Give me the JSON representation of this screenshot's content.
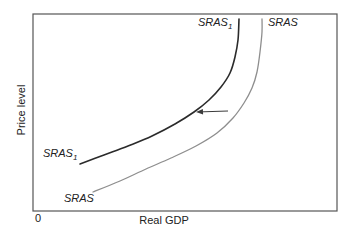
{
  "figure": {
    "y_axis_label": "Price level",
    "x_axis_label": "Real GDP",
    "origin_label": "0",
    "curve_labels": {
      "sras1_top": {
        "base": "SRAS",
        "sub": "1"
      },
      "sras_top": {
        "base": "SRAS",
        "sub": ""
      },
      "sras1_bottom": {
        "base": "SRAS",
        "sub": "1"
      },
      "sras_bottom": {
        "base": "SRAS",
        "sub": ""
      }
    },
    "colors": {
      "sras1_curve": "#2b2b2b",
      "sras_curve": "#8e8e8e",
      "plot_border": "#555555",
      "arrow": "#3a3a3a",
      "text": "#222222",
      "background": "#ffffff"
    }
  },
  "chart_data": {
    "type": "line",
    "title": "",
    "xlabel": "Real GDP",
    "ylabel": "Price level",
    "axis_values": "qualitative diagram - no numeric ticks, origin labeled 0",
    "layout": {
      "canvas": [
        348,
        239
      ],
      "plot_box": {
        "x": 33,
        "y": 14,
        "width": 304,
        "height": 197
      },
      "grid": false,
      "legend": "curve names labeled at top and bottom ends of each curve"
    },
    "series": [
      {
        "name": "SRAS1",
        "display_label": "SRAS₁",
        "color": "#2b2b2b",
        "stroke_width": 1.6,
        "points_px": [
          [
            80,
            164
          ],
          [
            104,
            155
          ],
          [
            128,
            146
          ],
          [
            152,
            136
          ],
          [
            175,
            124
          ],
          [
            194,
            112
          ],
          [
            209,
            100
          ],
          [
            221,
            87
          ],
          [
            230,
            73
          ],
          [
            235,
            57
          ],
          [
            238,
            40
          ],
          [
            239,
            19
          ]
        ]
      },
      {
        "name": "SRAS",
        "display_label": "SRAS",
        "color": "#8e8e8e",
        "stroke_width": 1.3,
        "points_px": [
          [
            93,
            192
          ],
          [
            120,
            181
          ],
          [
            146,
            169
          ],
          [
            171,
            158
          ],
          [
            196,
            146
          ],
          [
            217,
            133
          ],
          [
            233,
            118
          ],
          [
            244,
            103
          ],
          [
            252,
            88
          ],
          [
            257,
            72
          ],
          [
            260,
            52
          ],
          [
            262,
            32
          ],
          [
            262,
            19
          ]
        ]
      }
    ],
    "annotations": [
      {
        "type": "arrow",
        "from_px": [
          228,
          111
        ],
        "to_px": [
          196,
          112
        ],
        "color": "#3a3a3a",
        "meaning": "leftward shift of short-run aggregate supply from SRAS to SRAS1"
      }
    ]
  }
}
